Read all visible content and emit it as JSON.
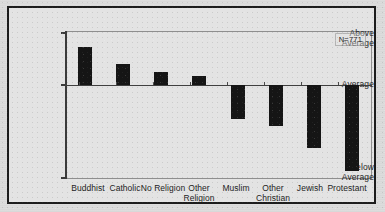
{
  "chart_data": {
    "type": "bar",
    "title": "",
    "subtitle": "",
    "xlabel": "",
    "ylabel": "",
    "categories": [
      "Buddhist",
      "Catholic",
      "No Religion",
      "Other Religion",
      "Muslim",
      "Other Christian",
      "Jewish",
      "Protestant"
    ],
    "category_lines": [
      [
        "Buddhist"
      ],
      [
        "Catholic"
      ],
      [
        "No Religion"
      ],
      [
        "Other",
        "Religion"
      ],
      [
        "Muslim"
      ],
      [
        "Other",
        "Christian"
      ],
      [
        "Jewish"
      ],
      [
        "Protestant"
      ]
    ],
    "values": [
      0.73,
      0.4,
      0.25,
      0.17,
      -0.37,
      -0.44,
      -0.68,
      -0.93
    ],
    "ylim": [
      -1,
      1
    ],
    "ytick_values": [
      1,
      0,
      -1
    ],
    "ytick_labels": [
      "Above Average",
      "Average",
      "Below Average"
    ],
    "ytick_label_lines": [
      [
        "Above",
        "Average"
      ],
      [
        "Average"
      ],
      [
        "Below",
        "Average"
      ]
    ],
    "grid": false,
    "legend": "none",
    "bar_color": "#151515",
    "annotations": [
      {
        "text": "N=771",
        "position": "top-right"
      }
    ]
  },
  "annotation": {
    "sample_size": "N=771"
  },
  "axis": {
    "above_average_line1": "Above",
    "above_average_line2": "Average",
    "average": "Average",
    "below_average_line1": "Below",
    "below_average_line2": "Average"
  },
  "categories": {
    "c0_line1": "Buddhist",
    "c0_line2": "",
    "c1_line1": "Catholic",
    "c1_line2": "",
    "c2_line1": "No Religion",
    "c2_line2": "",
    "c3_line1": "Other",
    "c3_line2": "Religion",
    "c4_line1": "Muslim",
    "c4_line2": "",
    "c5_line1": "Other",
    "c5_line2": "Christian",
    "c6_line1": "Jewish",
    "c6_line2": "",
    "c7_line1": "Protestant",
    "c7_line2": ""
  }
}
